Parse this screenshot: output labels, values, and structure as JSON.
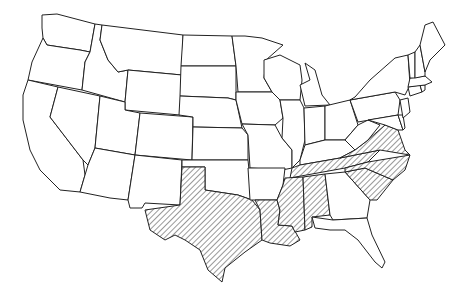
{
  "map": {
    "title": "",
    "region": "Contiguous United States",
    "fill_colors": {
      "default": "#ffffff",
      "outline": "#222222",
      "hatch": "#333333"
    },
    "hatched_states": [
      "Texas",
      "Louisiana",
      "Mississippi",
      "Alabama",
      "Tennessee",
      "Virginia",
      "North Carolina",
      "South Carolina"
    ],
    "states": [
      {
        "name": "Washington",
        "hatched": false
      },
      {
        "name": "Oregon",
        "hatched": false
      },
      {
        "name": "California",
        "hatched": false
      },
      {
        "name": "Idaho",
        "hatched": false
      },
      {
        "name": "Nevada",
        "hatched": false
      },
      {
        "name": "Montana",
        "hatched": false
      },
      {
        "name": "Wyoming",
        "hatched": false
      },
      {
        "name": "Utah",
        "hatched": false
      },
      {
        "name": "Arizona",
        "hatched": false
      },
      {
        "name": "Colorado",
        "hatched": false
      },
      {
        "name": "New Mexico",
        "hatched": false
      },
      {
        "name": "North Dakota",
        "hatched": false
      },
      {
        "name": "South Dakota",
        "hatched": false
      },
      {
        "name": "Nebraska",
        "hatched": false
      },
      {
        "name": "Kansas",
        "hatched": false
      },
      {
        "name": "Oklahoma",
        "hatched": false
      },
      {
        "name": "Texas",
        "hatched": true
      },
      {
        "name": "Minnesota",
        "hatched": false
      },
      {
        "name": "Iowa",
        "hatched": false
      },
      {
        "name": "Missouri",
        "hatched": false
      },
      {
        "name": "Arkansas",
        "hatched": false
      },
      {
        "name": "Louisiana",
        "hatched": true
      },
      {
        "name": "Wisconsin",
        "hatched": false
      },
      {
        "name": "Illinois",
        "hatched": false
      },
      {
        "name": "Michigan",
        "hatched": false
      },
      {
        "name": "Indiana",
        "hatched": false
      },
      {
        "name": "Ohio",
        "hatched": false
      },
      {
        "name": "Kentucky",
        "hatched": false
      },
      {
        "name": "Tennessee",
        "hatched": true
      },
      {
        "name": "Mississippi",
        "hatched": true
      },
      {
        "name": "Alabama",
        "hatched": true
      },
      {
        "name": "Georgia",
        "hatched": false
      },
      {
        "name": "Florida",
        "hatched": false
      },
      {
        "name": "South Carolina",
        "hatched": true
      },
      {
        "name": "North Carolina",
        "hatched": true
      },
      {
        "name": "Virginia",
        "hatched": true
      },
      {
        "name": "West Virginia",
        "hatched": false
      },
      {
        "name": "Pennsylvania",
        "hatched": false
      },
      {
        "name": "New York",
        "hatched": false
      },
      {
        "name": "Maryland",
        "hatched": false
      },
      {
        "name": "Delaware",
        "hatched": false
      },
      {
        "name": "New Jersey",
        "hatched": false
      },
      {
        "name": "Connecticut",
        "hatched": false
      },
      {
        "name": "Rhode Island",
        "hatched": false
      },
      {
        "name": "Massachusetts",
        "hatched": false
      },
      {
        "name": "Vermont",
        "hatched": false
      },
      {
        "name": "New Hampshire",
        "hatched": false
      },
      {
        "name": "Maine",
        "hatched": false
      }
    ]
  }
}
